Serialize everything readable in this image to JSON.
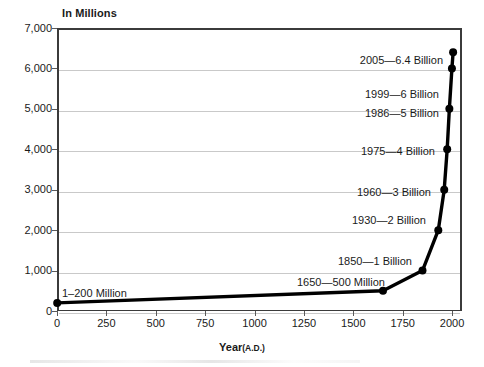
{
  "chart_data": {
    "type": "line",
    "title": "",
    "ylabel": "In Millions",
    "xlabel": "Year",
    "xlabel_suffix": "(A.D.)",
    "xlim": [
      0,
      2050
    ],
    "ylim": [
      0,
      7000
    ],
    "grid": true,
    "legend": "none",
    "x": [
      1,
      1650,
      1850,
      1930,
      1960,
      1975,
      1986,
      1999,
      2005
    ],
    "values": [
      200,
      500,
      1000,
      2000,
      3000,
      4000,
      5000,
      6000,
      6400
    ],
    "point_labels": [
      "1–200 Million",
      "1650—500 Million",
      "1850—1 Billion",
      "1930—2 Billion",
      "1960—3 Billion",
      "1975—4 Billion",
      "1986—5 Billion",
      "1999—6 Billion",
      "2005—6.4 Billion"
    ],
    "yticks": [
      0,
      1000,
      2000,
      3000,
      4000,
      5000,
      6000,
      7000
    ],
    "ytick_labels": [
      "0",
      "1,000",
      "2,000",
      "3,000",
      "4,000",
      "5,000",
      "6,000",
      "7,000"
    ],
    "xticks": [
      0,
      250,
      500,
      750,
      1000,
      1250,
      1500,
      1750,
      2000
    ],
    "xtick_labels": [
      "0",
      "250",
      "500",
      "750",
      "1000",
      "1250",
      "1500",
      "1750",
      "2000"
    ],
    "colors": {
      "line": "#000000",
      "marker": "#000000",
      "grid": "#c9c9c9",
      "frame": "#3b3b3b",
      "text": "#1a1a1a",
      "background": "#ffffff"
    }
  },
  "annotations": {
    "a1": "1–200 Million",
    "a1650": "1650—500 Million",
    "a1850": "1850—1 Billion",
    "a1930": "1930—2 Billion",
    "a1960": "1960—3 Billion",
    "a1975": "1975—4 Billion",
    "a1986": "1986—5 Billion",
    "a1999": "1999—6 Billion",
    "a2005": "2005—6.4 Billion"
  },
  "axes": {
    "y_title": "In Millions",
    "x_title": "Year",
    "x_title_suffix": "(A.D.)"
  }
}
